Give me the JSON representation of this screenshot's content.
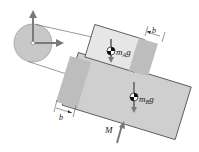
{
  "diagram": {
    "labels": {
      "mass_a_weight": "m",
      "mass_a_sub": "A",
      "mass_a_g": "g",
      "mass_b_weight": "m",
      "mass_b_sub": "B",
      "mass_b_g": "g",
      "dim_top": "b",
      "dim_bottom": "b",
      "moment": "M"
    },
    "colors": {
      "block_a": "#e6e6e6",
      "block_b": "#cfcfcf",
      "pads": "#bdbdbd",
      "pulley": "#c8c8c8",
      "arrows": "#7a7a7a",
      "lines": "#333333"
    }
  }
}
